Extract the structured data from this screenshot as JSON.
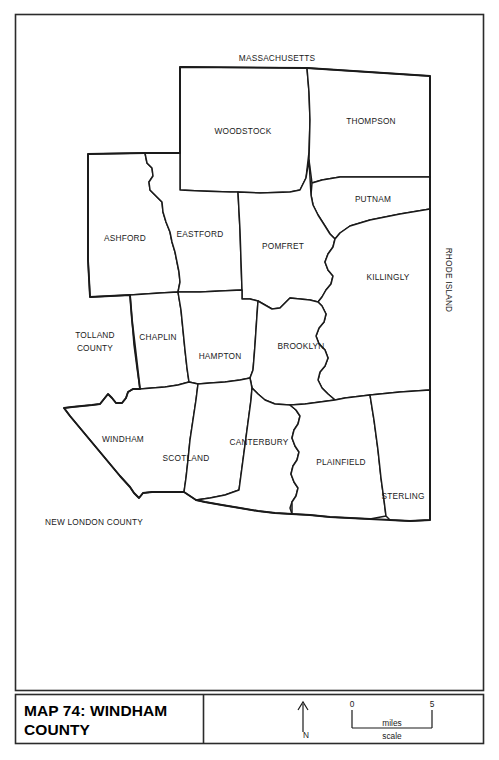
{
  "map": {
    "title_line1": "MAP 74: WINDHAM",
    "title_line2": "COUNTY",
    "neighbors": {
      "north": "MASSACHUSETTS",
      "east": "RHODE ISLAND",
      "west": "TOLLAND\nCOUNTY",
      "west_line1": "TOLLAND",
      "west_line2": "COUNTY",
      "south": "NEW LONDON COUNTY"
    },
    "towns": [
      {
        "name": "WOODSTOCK",
        "label_x": 243,
        "label_y": 134
      },
      {
        "name": "THOMPSON",
        "label_x": 371,
        "label_y": 124
      },
      {
        "name": "PUTNAM",
        "label_x": 373,
        "label_y": 202
      },
      {
        "name": "ASHFORD",
        "label_x": 125,
        "label_y": 241
      },
      {
        "name": "EASTFORD",
        "label_x": 200,
        "label_y": 237
      },
      {
        "name": "POMFRET",
        "label_x": 283,
        "label_y": 249
      },
      {
        "name": "KILLINGLY",
        "label_x": 388,
        "label_y": 280
      },
      {
        "name": "CHAPLIN",
        "label_x": 158,
        "label_y": 340
      },
      {
        "name": "HAMPTON",
        "label_x": 220,
        "label_y": 359
      },
      {
        "name": "BROOKLYN",
        "label_x": 301,
        "label_y": 349
      },
      {
        "name": "WINDHAM",
        "label_x": 123,
        "label_y": 442
      },
      {
        "name": "SCOTLAND",
        "label_x": 186,
        "label_y": 461
      },
      {
        "name": "CANTERBURY",
        "label_x": 259,
        "label_y": 445
      },
      {
        "name": "PLAINFIELD",
        "label_x": 341,
        "label_y": 465
      },
      {
        "name": "STERLING",
        "label_x": 403,
        "label_y": 499
      }
    ],
    "scale": {
      "min": "0",
      "max": "5",
      "units": "miles",
      "caption": "scale"
    },
    "compass": {
      "direction": "N"
    }
  }
}
